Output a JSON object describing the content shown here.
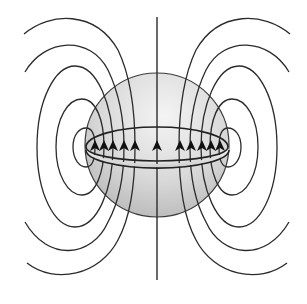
{
  "figure": {
    "colors": {
      "background": "#ffffff",
      "line": "#2b2b2b",
      "sphere_highlight": "#f2f2f2",
      "sphere_shadow": "#b5b5b5",
      "ring_band": "#ececec",
      "arrow": "#111111"
    },
    "sphere": {
      "cx": 157,
      "cy": 145,
      "r": 72
    },
    "ring": {
      "cx": 157,
      "cy": 147,
      "rx": 72,
      "ry": 19,
      "thickness": 6
    },
    "axis": {
      "x": 157,
      "y1": 17,
      "y2": 280
    },
    "arrows": {
      "direction": "up",
      "left_x": [
        95,
        104,
        113,
        124,
        135
      ],
      "center_x": [
        157
      ],
      "right_x": [
        180,
        191,
        202,
        211,
        220
      ],
      "tip_y": 140,
      "base_y": 151
    },
    "field_line_count_per_side": 5
  }
}
